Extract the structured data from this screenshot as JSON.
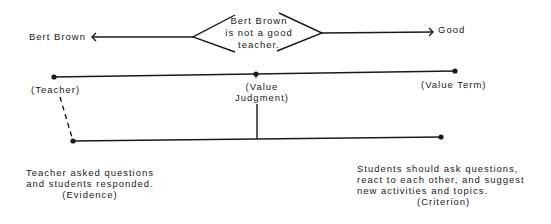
{
  "diagram": {
    "claim": {
      "lines": [
        "Bert Brown",
        "is not a good",
        "teacher."
      ]
    },
    "subject_label": "Bert Brown",
    "predicate_label": "Good",
    "top_line": {
      "nodes": [
        {
          "label": "(Teacher)"
        },
        {
          "label_lines": [
            "(Value",
            "Judgment)"
          ]
        },
        {
          "label": "(Value Term)"
        }
      ]
    },
    "evidence": {
      "lines": [
        "Teacher asked questions",
        "and students responded."
      ],
      "tag": "(Evidence)"
    },
    "criterion": {
      "lines": [
        "Students should ask questions,",
        "react to each other, and suggest",
        "new activities and topics."
      ],
      "tag": "(Criterion)"
    }
  }
}
